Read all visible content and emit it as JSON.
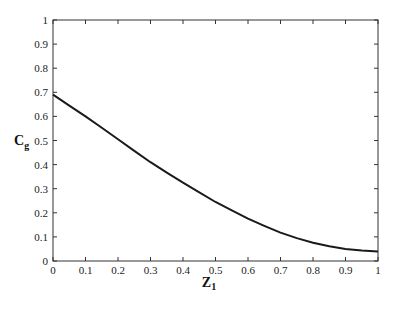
{
  "chart_data": {
    "type": "line",
    "title": "",
    "xlabel": "Z",
    "xlabel_subscript": "1",
    "ylabel": "C",
    "ylabel_subscript": "g",
    "xlim": [
      0,
      1
    ],
    "ylim": [
      0,
      1
    ],
    "grid": false,
    "legend": null,
    "x_ticks": [
      "0",
      "0.1",
      "0.2",
      "0.3",
      "0.4",
      "0.5",
      "0.6",
      "0.7",
      "0.8",
      "0.9",
      "1"
    ],
    "y_ticks": [
      "0",
      "0.1",
      "0.2",
      "0.3",
      "0.4",
      "0.5",
      "0.6",
      "0.7",
      "0.8",
      "0.9",
      "1"
    ],
    "series": [
      {
        "name": "Cg",
        "color": "#1a1a1a",
        "x": [
          0,
          0.05,
          0.1,
          0.15,
          0.2,
          0.25,
          0.3,
          0.35,
          0.4,
          0.45,
          0.5,
          0.55,
          0.6,
          0.65,
          0.7,
          0.75,
          0.8,
          0.85,
          0.9,
          0.95,
          1.0
        ],
        "values": [
          0.69,
          0.645,
          0.6,
          0.553,
          0.505,
          0.457,
          0.41,
          0.367,
          0.325,
          0.285,
          0.245,
          0.21,
          0.176,
          0.146,
          0.118,
          0.095,
          0.076,
          0.061,
          0.05,
          0.043,
          0.04
        ]
      }
    ]
  }
}
